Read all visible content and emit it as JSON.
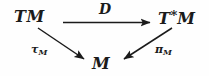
{
  "diagram": {
    "kind": "commutative-diagram",
    "background_color": "#fefefe",
    "ink_color": "#1b1b1b",
    "nodes": [
      {
        "id": "tm",
        "label": "TM",
        "base": "T",
        "modifier": "",
        "suffix": "M",
        "position": "top-left"
      },
      {
        "id": "tstarm",
        "label": "T*M",
        "base": "T",
        "modifier": "*",
        "suffix": "M",
        "position": "top-right"
      },
      {
        "id": "m",
        "label": "M",
        "base": "M",
        "modifier": "",
        "suffix": "",
        "position": "bottom-center"
      }
    ],
    "arrows": [
      {
        "id": "d",
        "label": "D",
        "label_base": "D",
        "label_sub": "",
        "from": "tm",
        "to": "tstarm",
        "direction": "horizontal-right",
        "label_position": "above"
      },
      {
        "id": "tau-m",
        "label": "τM",
        "label_base": "τ",
        "label_sub": "M",
        "from": "tm",
        "to": "m",
        "direction": "diagonal-down-right",
        "label_position": "left"
      },
      {
        "id": "pi-m",
        "label": "πM",
        "label_base": "π",
        "label_sub": "M",
        "from": "tstarm",
        "to": "m",
        "direction": "diagonal-down-left",
        "label_position": "right"
      }
    ]
  }
}
